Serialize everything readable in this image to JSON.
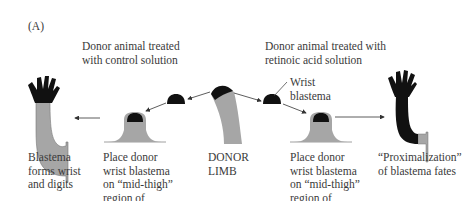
{
  "panel_label": "(A)",
  "headers": {
    "control": [
      "Donor animal treated",
      "with control solution"
    ],
    "retinoic": [
      "Donor animal treated with",
      "retinoic acid solution"
    ]
  },
  "callout": [
    "Wrist",
    "blastema"
  ],
  "captions": {
    "blastema_forms": [
      "Blastema",
      "forms wrist",
      "and digits"
    ],
    "place_left": [
      "Place donor",
      "wrist blastema",
      "on “mid-thigh”",
      "region of"
    ],
    "donor_limb": [
      "DONOR",
      "LIMB"
    ],
    "place_right": [
      "Place donor",
      "wrist blastema",
      "on “mid-thigh”",
      "region of"
    ],
    "proximalization": [
      "“Proximalization”",
      "of blastema fates"
    ]
  },
  "colors": {
    "tissue_gray": "#a6a6a6",
    "blastema_black": "#111111",
    "arrow": "#333333",
    "text": "#3a3a3a"
  }
}
